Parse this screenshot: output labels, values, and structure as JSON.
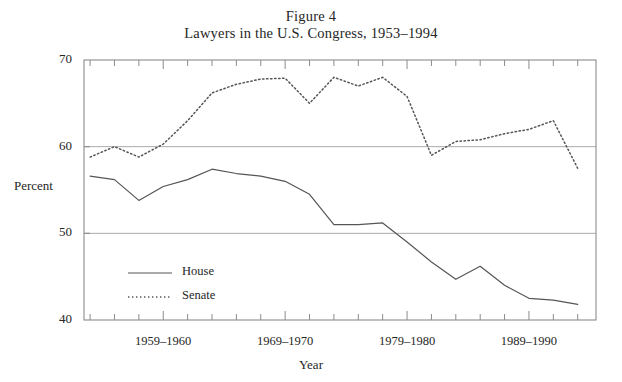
{
  "figure": {
    "caption_number": "Figure 4",
    "caption_title": "Lawyers in the U.S. Congress, 1953–1994",
    "xlabel": "Year",
    "ylabel": "Percent"
  },
  "legend": {
    "house_label": "House",
    "senate_label": "Senate"
  },
  "axis": {
    "y_ticks": [
      "40",
      "50",
      "60",
      "70"
    ],
    "x_ticks": [
      "1959–1960",
      "1969–1970",
      "1979–1980",
      "1989–1990"
    ]
  },
  "colors": {
    "line": "#55555a",
    "grid": "#aaaaaa",
    "frame": "#8c8c90",
    "background": "#ffffff",
    "text": "#262626"
  },
  "chart_data": {
    "type": "line",
    "title": "Lawyers in the U.S. Congress, 1953–1994",
    "subtitle": "Figure 4",
    "xlabel": "Year",
    "ylabel": "Percent",
    "xlim": [
      1953,
      1994
    ],
    "ylim": [
      40,
      70
    ],
    "grid": true,
    "gridlines_y": [
      50,
      60
    ],
    "legend_position": "inside-lower-left",
    "x_tick_values": [
      1959,
      1969,
      1979,
      1989
    ],
    "x_tick_labels": [
      "1959–1960",
      "1969–1970",
      "1979–1980",
      "1989–1990"
    ],
    "y_tick_values": [
      40,
      50,
      60,
      70
    ],
    "x": [
      1953,
      1955,
      1957,
      1959,
      1961,
      1963,
      1965,
      1967,
      1969,
      1971,
      1973,
      1975,
      1977,
      1979,
      1981,
      1983,
      1985,
      1987,
      1989,
      1991,
      1993
    ],
    "x_labels": [
      "1953–1954",
      "1955–1956",
      "1957–1958",
      "1959–1960",
      "1961–1962",
      "1963–1964",
      "1965–1966",
      "1967–1968",
      "1969–1970",
      "1971–1972",
      "1973–1974",
      "1975–1976",
      "1977–1978",
      "1979–1980",
      "1981–1982",
      "1983–1984",
      "1985–1986",
      "1987–1988",
      "1989–1990",
      "1991–1992",
      "1993–1994"
    ],
    "series": [
      {
        "name": "House",
        "style": "solid",
        "values": [
          56.6,
          56.2,
          53.8,
          55.4,
          56.2,
          57.4,
          56.9,
          56.6,
          56.0,
          54.5,
          51.0,
          51.0,
          51.2,
          49.0,
          46.7,
          44.7,
          46.2,
          44.0,
          42.5,
          42.3,
          41.8
        ]
      },
      {
        "name": "Senate",
        "style": "dotted",
        "values": [
          58.8,
          60.0,
          58.8,
          60.3,
          63.0,
          66.2,
          67.2,
          67.8,
          67.9,
          65.0,
          68.0,
          67.0,
          68.0,
          65.8,
          59.0,
          60.6,
          60.8,
          61.5,
          62.0,
          63.0,
          57.5
        ]
      }
    ]
  }
}
